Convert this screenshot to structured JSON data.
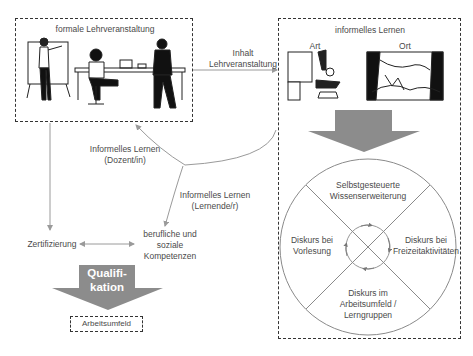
{
  "diagram": {
    "formal_box": {
      "title": "formale Lehrveranstaltung"
    },
    "informal_box": {
      "title": "informelles Lernen",
      "col_art": "Art",
      "col_ort": "Ort"
    },
    "connector_content": {
      "line1": "Inhalt",
      "line2": "Lehrveranstaltung"
    },
    "informal_lecturer": {
      "line1": "Informelles Lernen",
      "line2": "(Dozent/in)"
    },
    "informal_learner": {
      "line1": "Informelles Lernen",
      "line2": "(Lernende/r)"
    },
    "certification": "Zertifizierung",
    "competences": {
      "line1": "berufliche und",
      "line2": "soziale",
      "line3": "Kompetenzen"
    },
    "qualification_arrow": {
      "line1": "Qualifi-",
      "line2": "kation"
    },
    "workplace": "Arbeitsumfeld",
    "circle": {
      "top": {
        "line1": "Selbstgesteuerte",
        "line2": "Wissenserweiterung"
      },
      "left": {
        "line1": "Diskurs bei",
        "line2": "Vorlesung"
      },
      "right": {
        "line1": "Diskurs bei",
        "line2": "Freizeitaktivitäten"
      },
      "bottom": {
        "line1": "Diskurs  im",
        "line2": "Arbeitsumfeld /",
        "line3": "Lerngruppen"
      }
    },
    "colors": {
      "arrow_fill": "#8c8c8c",
      "line": "#9a9a9a",
      "box_border": "#333333",
      "text": "#4a4a4a"
    }
  }
}
